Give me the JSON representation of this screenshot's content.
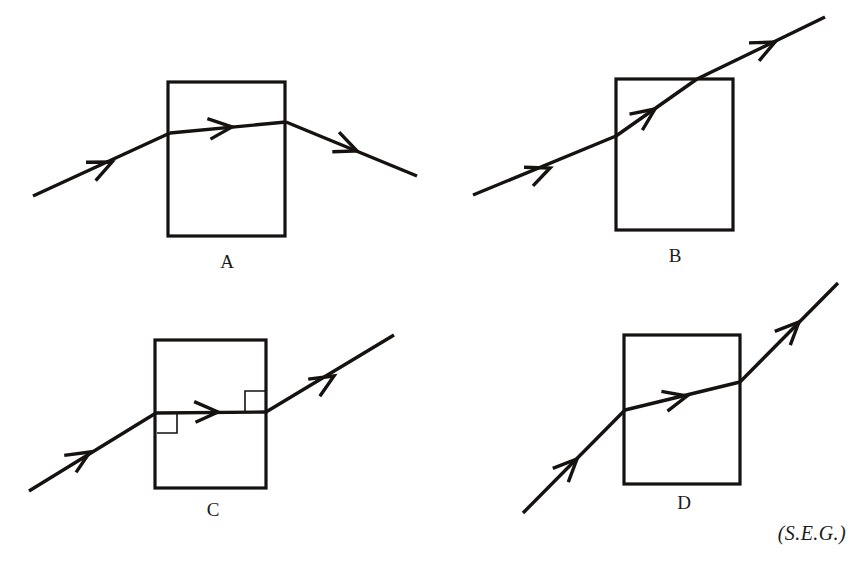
{
  "figure": {
    "background_color": "#ffffff",
    "ink_color": "#15120f",
    "credit": "(S.E.G.)",
    "panels": [
      {
        "id": "A",
        "label": "A",
        "label_x": 227,
        "label_y": 268,
        "description": "ray bends downward on entering and exits below the normal",
        "box": {
          "x": 168,
          "y": 82,
          "width": 117,
          "height": 154
        },
        "rays": [
          {
            "name": "incident-ray-a",
            "x1": 33,
            "y1": 196,
            "x2": 170,
            "y2": 133
          },
          {
            "name": "internal-ray-a",
            "x1": 170,
            "y1": 133,
            "x2": 286,
            "y2": 122
          },
          {
            "name": "exit-ray-a",
            "x1": 286,
            "y1": 122,
            "x2": 417,
            "y2": 176
          }
        ],
        "arrows": [
          {
            "name": "arrowhead-incident-a",
            "x": 112,
            "y": 162,
            "angle": -24.6
          },
          {
            "name": "arrowhead-internal-a",
            "x": 232,
            "y": 127,
            "angle": -5.4
          },
          {
            "name": "arrowhead-exit-a",
            "x": 357,
            "y": 151,
            "angle": 22.4
          }
        ],
        "angle_marks": []
      },
      {
        "id": "B",
        "label": "B",
        "label_x": 675,
        "label_y": 262,
        "description": "ray passes straight through undeviated at a steep angle",
        "box": {
          "x": 616,
          "y": 79,
          "width": 117,
          "height": 151
        },
        "rays": [
          {
            "name": "incident-ray-b",
            "x1": 473,
            "y1": 195,
            "x2": 616,
            "y2": 136
          },
          {
            "name": "internal-ray-b",
            "x1": 616,
            "y1": 136,
            "x2": 697,
            "y2": 79
          },
          {
            "name": "exit-ray-b",
            "x1": 697,
            "y1": 79,
            "x2": 825,
            "y2": 17
          }
        ],
        "arrows": [
          {
            "name": "arrowhead-incident-b",
            "x": 550,
            "y": 168,
            "angle": -22.4
          },
          {
            "name": "arrowhead-internal-b",
            "x": 655,
            "y": 109,
            "angle": -35.2
          },
          {
            "name": "arrowhead-exit-b",
            "x": 775,
            "y": 42,
            "angle": -25.9
          }
        ],
        "angle_marks": []
      },
      {
        "id": "C",
        "label": "C",
        "label_x": 213,
        "label_y": 516,
        "description": "ray refracts to horizontal inside the block, right angles marked at both faces",
        "box": {
          "x": 155,
          "y": 340,
          "width": 111,
          "height": 148
        },
        "rays": [
          {
            "name": "incident-ray-c",
            "x1": 29,
            "y1": 491,
            "x2": 156,
            "y2": 413
          },
          {
            "name": "internal-ray-c",
            "x1": 156,
            "y1": 413,
            "x2": 266,
            "y2": 412
          },
          {
            "name": "exit-ray-c",
            "x1": 266,
            "y1": 412,
            "x2": 394,
            "y2": 335
          }
        ],
        "arrows": [
          {
            "name": "arrowhead-incident-c",
            "x": 90,
            "y": 452,
            "angle": -31.6
          },
          {
            "name": "arrowhead-internal-c",
            "x": 218,
            "y": 412,
            "angle": -0.5
          },
          {
            "name": "arrowhead-exit-c",
            "x": 334,
            "y": 376,
            "angle": -31.0
          }
        ],
        "angle_marks": [
          {
            "name": "right-angle-mark-entry",
            "x": 157,
            "y": 413,
            "size": 20,
            "dir_x": 1,
            "dir_y": 1
          },
          {
            "name": "right-angle-mark-exit",
            "x": 265,
            "y": 411,
            "size": 20,
            "dir_x": -1,
            "dir_y": -1
          }
        ]
      },
      {
        "id": "D",
        "label": "D",
        "label_x": 684,
        "label_y": 509,
        "description": "ray bends toward the horizontal inside the block then resumes its steep path",
        "box": {
          "x": 624,
          "y": 335,
          "width": 116,
          "height": 149
        },
        "rays": [
          {
            "name": "incident-ray-d",
            "x1": 523,
            "y1": 513,
            "x2": 625,
            "y2": 410
          },
          {
            "name": "internal-ray-d",
            "x1": 625,
            "y1": 410,
            "x2": 740,
            "y2": 382
          },
          {
            "name": "exit-ray-d",
            "x1": 740,
            "y1": 382,
            "x2": 838,
            "y2": 283
          }
        ],
        "arrows": [
          {
            "name": "arrowhead-incident-d",
            "x": 577,
            "y": 459,
            "angle": -45.3
          },
          {
            "name": "arrowhead-internal-d",
            "x": 687,
            "y": 396,
            "angle": -13.7
          },
          {
            "name": "arrowhead-exit-d",
            "x": 799,
            "y": 322,
            "angle": -45.3
          }
        ],
        "angle_marks": []
      }
    ]
  }
}
